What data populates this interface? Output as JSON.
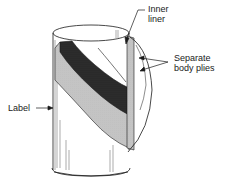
{
  "diagram": {
    "labels": {
      "inner_liner_line1": "Inner",
      "inner_liner_line2": "liner",
      "body_plies_line1": "Separate",
      "body_plies_line2": "body plies",
      "label": "Label"
    },
    "colors": {
      "stroke": "#1a1a1a",
      "dark_ply": "#2a2a2a",
      "dotted_ply": "#9a9a9a",
      "background": "#ffffff"
    }
  }
}
